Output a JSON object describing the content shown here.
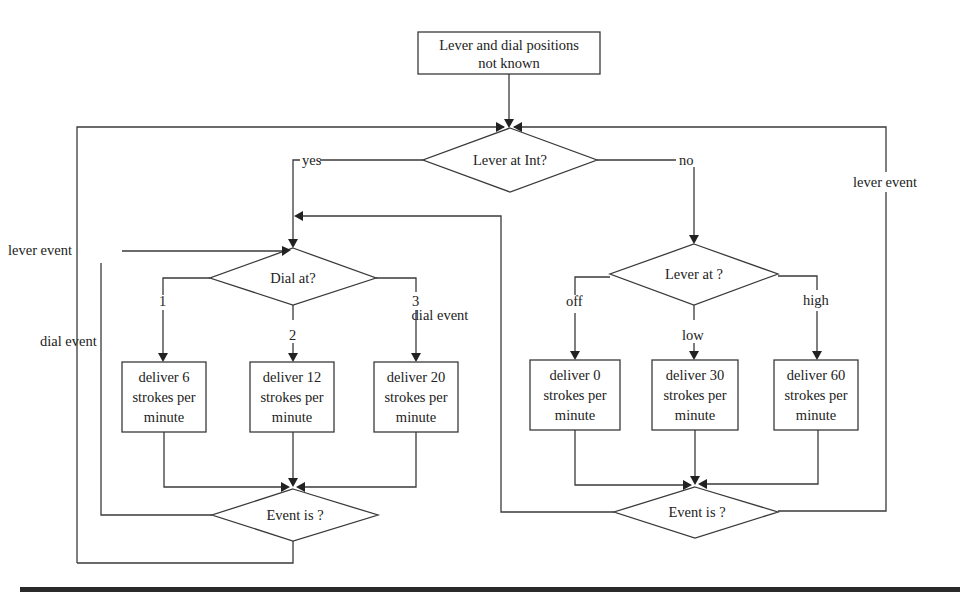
{
  "diagram": {
    "type": "flowchart",
    "start": {
      "line1": "Lever and dial positions",
      "line2": "not known"
    },
    "decisions": {
      "lever_int": "Lever at Int?",
      "dial_at": "Dial at?",
      "lever_at": "Lever at ?",
      "event_left": "Event is ?",
      "event_right": "Event is ?"
    },
    "branch_labels": {
      "yes": "yes",
      "no": "no",
      "dial_1": "1",
      "dial_2": "2",
      "dial_3": "3",
      "lever_off": "off",
      "lever_low": "low",
      "lever_high": "high"
    },
    "loop_labels": {
      "left_lever_event": "lever event",
      "left_dial_event": "dial event",
      "right_dial_event": "dial event",
      "right_lever_event": "lever event"
    },
    "actions": [
      {
        "line1": "deliver 6",
        "line2": "strokes per",
        "line3": "minute"
      },
      {
        "line1": "deliver 12",
        "line2": "strokes per",
        "line3": "minute"
      },
      {
        "line1": "deliver 20",
        "line2": "strokes per",
        "line3": "minute"
      },
      {
        "line1": "deliver 0",
        "line2": "strokes per",
        "line3": "minute"
      },
      {
        "line1": "deliver 30",
        "line2": "strokes per",
        "line3": "minute"
      },
      {
        "line1": "deliver 60",
        "line2": "strokes per",
        "line3": "minute"
      }
    ]
  }
}
